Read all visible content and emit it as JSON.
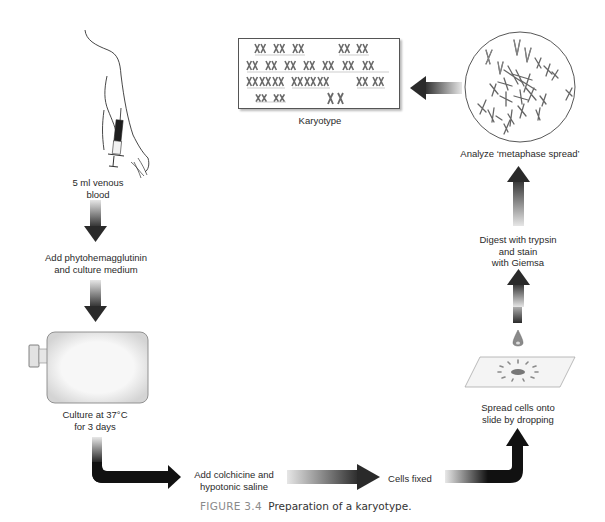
{
  "figure": {
    "number": "FIGURE 3.4",
    "title": "Preparation of a karyotype."
  },
  "steps": [
    {
      "id": "blood",
      "lines": [
        "5 ml venous",
        "blood"
      ],
      "icon": "arm-syringe-icon"
    },
    {
      "id": "phyto",
      "lines": [
        "Add phytohemagglutinin",
        "and culture medium"
      ]
    },
    {
      "id": "culture",
      "lines": [
        "Culture at 37°C",
        "for 3 days"
      ],
      "icon": "culture-flask-icon"
    },
    {
      "id": "colchicine",
      "lines": [
        "Add colchicine and",
        "hypotonic saline"
      ]
    },
    {
      "id": "fixed",
      "lines": [
        "Cells fixed"
      ]
    },
    {
      "id": "spread",
      "lines": [
        "Spread cells onto",
        "slide by dropping"
      ],
      "icon": "slide-drop-icon"
    },
    {
      "id": "digest",
      "lines": [
        "Digest with trypsin",
        "and stain",
        "with Giemsa"
      ]
    },
    {
      "id": "analyze",
      "lines": [
        "Analyze ‘metaphase spread’"
      ],
      "icon": "metaphase-spread-icon"
    },
    {
      "id": "karyotype",
      "lines": [
        "Karyotype"
      ],
      "icon": "karyotype-chart-icon"
    }
  ],
  "colors": {
    "arrow_dark": "#1a1a1a",
    "arrow_light": "#e0e0e0",
    "outline": "#555555",
    "chromosome": "#6a6a6a",
    "flask_fill": "#ececec"
  }
}
